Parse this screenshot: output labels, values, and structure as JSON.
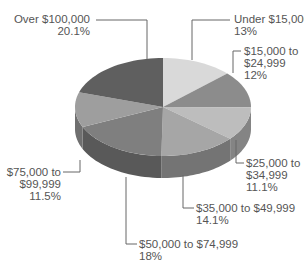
{
  "chart_data": {
    "type": "pie",
    "style": "3d-exploded-none",
    "title": "",
    "categories": [
      "Under $15,000",
      "$15,000 to $24,999",
      "$25,000 to $34,999",
      "$35,000 to $49,999",
      "$50,000 to $74,999",
      "$75,000 to $99,999",
      "Over $100,000"
    ],
    "values": [
      13,
      12,
      11.1,
      14.1,
      18,
      11.5,
      20.1
    ],
    "unit": "%",
    "legend": "none (leader-line labels)",
    "slice_colors": [
      "#d9d9d9",
      "#8c8c8c",
      "#bdbdbd",
      "#a6a6a6",
      "#7f7f7f",
      "#9e9e9e",
      "#5f5f5f"
    ]
  },
  "labels": [
    {
      "line1": "Under $15,000",
      "line2": "13%"
    },
    {
      "line1": "$15,000 to",
      "line2": "$24,999",
      "line3": "12%"
    },
    {
      "line1": "$25,000 to",
      "line2": "$34,999",
      "line3": "11.1%"
    },
    {
      "line1": "$35,000 to $49,999",
      "line2": "14.1%"
    },
    {
      "line1": "$50,000 to $74,999",
      "line2": "18%"
    },
    {
      "line1": "$75,000 to",
      "line2": "$99,999",
      "line3": "11.5%"
    },
    {
      "line1": "Over $100,000",
      "line2": "20.1%"
    }
  ]
}
